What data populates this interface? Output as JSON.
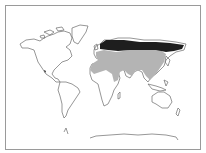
{
  "map": {
    "type": "world-distribution-map",
    "projection": "world outline",
    "regions": [
      {
        "name": "northern-eurasia-range",
        "fill": "#1e1e1e",
        "description": "dark shaded band across northern Europe and Siberia"
      },
      {
        "name": "southern-eurasia-africa-range",
        "fill": "#b4b4b4",
        "description": "light gray shading across Europe, central/southern Asia, Middle East and northern Africa"
      }
    ],
    "colors": {
      "background": "#ffffff",
      "border": "#9a9a9a",
      "coastline": "#6a6a6a",
      "dark_range": "#1e1e1e",
      "light_range": "#b4b4b4"
    }
  }
}
